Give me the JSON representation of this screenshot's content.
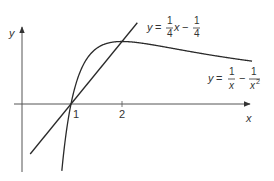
{
  "diagram": {
    "type": "function-graph",
    "axes": {
      "x_label": "x",
      "y_label": "y"
    },
    "x_ticks": [
      {
        "value": 1,
        "label": "1"
      },
      {
        "value": 2,
        "label": "2"
      }
    ],
    "curves": [
      {
        "name": "curve",
        "equation": "y = 1/x - 1/x^2",
        "label": {
          "lhs": "y =",
          "f1_num": "1",
          "f1_den": "x",
          "op": "−",
          "f2_num": "1",
          "f2_den": "x",
          "f2_den_exp": "2"
        }
      },
      {
        "name": "line",
        "equation": "y = x/4 - 1/4",
        "label": {
          "lhs": "y =",
          "f1_num": "1",
          "f1_den": "4",
          "var": "x",
          "op": "−",
          "f2_num": "1",
          "f2_den": "4"
        }
      }
    ],
    "key_points": [
      {
        "x": 1,
        "y": 0,
        "description": "intersection on x-axis"
      },
      {
        "x": 2,
        "y": 0.25,
        "description": "maximum of curve, intersection with line"
      }
    ]
  },
  "colors": {
    "ink": "#2a2a2a",
    "axis": "#555555",
    "text": "#333333"
  }
}
